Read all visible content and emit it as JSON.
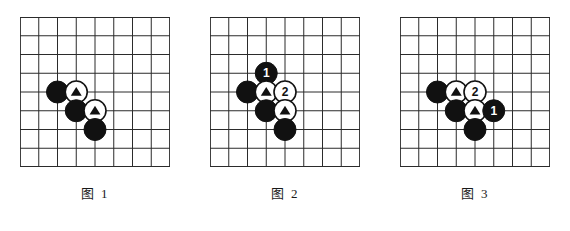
{
  "figure": {
    "board": {
      "cells": 8,
      "lines": 9,
      "cell_size": 18.75,
      "line_color": "#2b2b2b",
      "background_color": "#ffffff",
      "stone_radius": 11
    },
    "colors": {
      "black_stone": "#111111",
      "white_stone": "#ffffff",
      "stone_outline": "#111111",
      "black_label_text": "#ffffff",
      "white_label_text": "#111111",
      "marker_triangle": "#111111"
    },
    "panels": [
      {
        "id": "panel-1",
        "caption": "图 1",
        "stones": [
          {
            "name": "black-stone-a",
            "color": "black",
            "col": 2,
            "row": 4,
            "marker": "none",
            "label": ""
          },
          {
            "name": "white-stone-triangle-upper",
            "color": "white",
            "col": 3,
            "row": 4,
            "marker": "triangle",
            "label": ""
          },
          {
            "name": "black-stone-b",
            "color": "black",
            "col": 3,
            "row": 5,
            "marker": "none",
            "label": ""
          },
          {
            "name": "white-stone-triangle-lower",
            "color": "white",
            "col": 4,
            "row": 5,
            "marker": "triangle",
            "label": ""
          },
          {
            "name": "black-stone-c",
            "color": "black",
            "col": 4,
            "row": 6,
            "marker": "none",
            "label": ""
          }
        ]
      },
      {
        "id": "panel-2",
        "caption": "图 2",
        "stones": [
          {
            "name": "black-stone-move-1",
            "color": "black",
            "col": 3,
            "row": 3,
            "marker": "label",
            "label": "1"
          },
          {
            "name": "black-stone-a",
            "color": "black",
            "col": 2,
            "row": 4,
            "marker": "none",
            "label": ""
          },
          {
            "name": "white-stone-triangle-upper",
            "color": "white",
            "col": 3,
            "row": 4,
            "marker": "triangle",
            "label": ""
          },
          {
            "name": "white-stone-move-2",
            "color": "white",
            "col": 4,
            "row": 4,
            "marker": "label",
            "label": "2"
          },
          {
            "name": "black-stone-b",
            "color": "black",
            "col": 3,
            "row": 5,
            "marker": "none",
            "label": ""
          },
          {
            "name": "white-stone-triangle-lower",
            "color": "white",
            "col": 4,
            "row": 5,
            "marker": "triangle",
            "label": ""
          },
          {
            "name": "black-stone-c",
            "color": "black",
            "col": 4,
            "row": 6,
            "marker": "none",
            "label": ""
          }
        ]
      },
      {
        "id": "panel-3",
        "caption": "图 3",
        "stones": [
          {
            "name": "black-stone-a",
            "color": "black",
            "col": 2,
            "row": 4,
            "marker": "none",
            "label": ""
          },
          {
            "name": "white-stone-triangle-upper",
            "color": "white",
            "col": 3,
            "row": 4,
            "marker": "triangle",
            "label": ""
          },
          {
            "name": "white-stone-move-2",
            "color": "white",
            "col": 4,
            "row": 4,
            "marker": "label",
            "label": "2"
          },
          {
            "name": "black-stone-b",
            "color": "black",
            "col": 3,
            "row": 5,
            "marker": "none",
            "label": ""
          },
          {
            "name": "white-stone-triangle-lower",
            "color": "white",
            "col": 4,
            "row": 5,
            "marker": "triangle",
            "label": ""
          },
          {
            "name": "black-stone-move-1",
            "color": "black",
            "col": 5,
            "row": 5,
            "marker": "label",
            "label": "1"
          },
          {
            "name": "black-stone-c",
            "color": "black",
            "col": 4,
            "row": 6,
            "marker": "none",
            "label": ""
          }
        ]
      }
    ]
  }
}
